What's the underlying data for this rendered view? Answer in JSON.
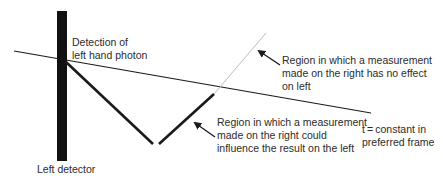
{
  "diagram": {
    "colors": {
      "line": "#1a1a1a",
      "light_line": "#bdbdbd",
      "detector": "#111111",
      "text": "#2b2b2b",
      "background": "#ffffff"
    },
    "labels": {
      "detection": [
        "Detection of",
        "left hand photon"
      ],
      "no_effect_region": [
        "Region in which a measurement",
        "made on the right has no effect",
        "on left"
      ],
      "influence_region": [
        "Region in which a measurement",
        "made on the right could",
        "influence the result on the left"
      ],
      "time_line": [
        "t = constant in",
        "preferred frame"
      ],
      "detector": "Left detector"
    },
    "elements": {
      "detector_bar": {
        "x": 57,
        "y": 11,
        "width": 10,
        "height": 150
      },
      "t_constant_line": {
        "x1": 14,
        "y1": 51,
        "x2": 371,
        "y2": 113
      },
      "left_diagonal": {
        "x1": 66,
        "y1": 62,
        "x2": 153,
        "y2": 144
      },
      "right_diagonal": {
        "x1": 159,
        "y1": 144,
        "x2": 214,
        "y2": 94
      },
      "light_cone_line": {
        "x1": 214,
        "y1": 94,
        "x2": 266,
        "y2": 33
      },
      "arrow_no_effect": {
        "x1": 280,
        "y1": 65,
        "x2": 258,
        "y2": 50
      },
      "arrow_influence": {
        "x1": 215,
        "y1": 137,
        "x2": 194,
        "y2": 122
      }
    }
  }
}
